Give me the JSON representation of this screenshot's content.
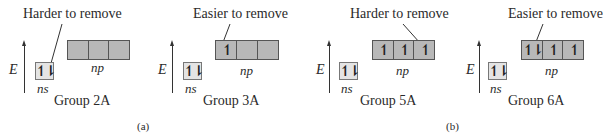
{
  "figure": {
    "axis_label": "E",
    "ns_label": "ns",
    "np_label": "np",
    "panels": [
      {
        "group": "Group 2A",
        "callout": "Harder to remove",
        "ns": "↿⇂",
        "np": [
          "",
          "",
          ""
        ],
        "callout_target": "ns electron pair"
      },
      {
        "group": "Group 3A",
        "callout": "Easier to remove",
        "ns": "↿⇂",
        "np": [
          "↿",
          "",
          ""
        ],
        "callout_target": "single np electron"
      },
      {
        "group": "Group 5A",
        "callout": "Harder to remove",
        "ns": "↿⇂",
        "np": [
          "↿",
          "↿",
          "↿"
        ],
        "callout_target": "third unpaired np electron"
      },
      {
        "group": "Group 6A",
        "callout": "Easier to remove",
        "ns": "↿⇂",
        "np": [
          "↿⇂",
          "↿",
          "↿"
        ],
        "callout_target": "paired np electron"
      }
    ],
    "part_labels": [
      "(a)",
      "(b)"
    ]
  }
}
